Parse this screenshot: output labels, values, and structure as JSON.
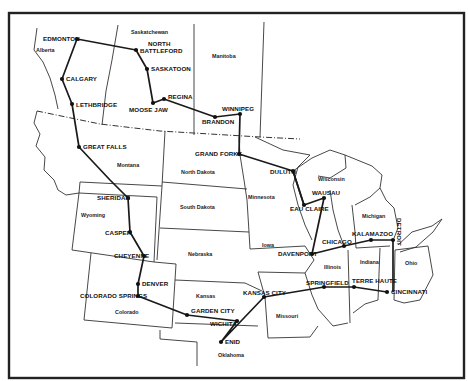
{
  "map": {
    "regions": [
      {
        "id": "alberta",
        "label": "Alberta",
        "x": 36,
        "y": 52
      },
      {
        "id": "saskatchewan",
        "label": "Saskatchewan",
        "x": 131,
        "y": 34
      },
      {
        "id": "manitoba",
        "label": "Manitoba",
        "x": 212,
        "y": 58
      },
      {
        "id": "montana",
        "label": "Montana",
        "x": 117,
        "y": 167
      },
      {
        "id": "north-dakota",
        "label": "North Dakota",
        "x": 181,
        "y": 174
      },
      {
        "id": "south-dakota",
        "label": "South Dakota",
        "x": 180,
        "y": 209
      },
      {
        "id": "minnesota",
        "label": "Minnesota",
        "x": 248,
        "y": 199
      },
      {
        "id": "wisconsin",
        "label": "Wisconsin",
        "x": 318,
        "y": 181
      },
      {
        "id": "michigan",
        "label": "Michigan",
        "x": 362,
        "y": 218
      },
      {
        "id": "wyoming",
        "label": "Wyoming",
        "x": 81,
        "y": 217
      },
      {
        "id": "nebraska",
        "label": "Nebraska",
        "x": 188,
        "y": 256
      },
      {
        "id": "iowa",
        "label": "Iowa",
        "x": 262,
        "y": 247
      },
      {
        "id": "illinois",
        "label": "Illinois",
        "x": 324,
        "y": 269
      },
      {
        "id": "indiana",
        "label": "Indiana",
        "x": 360,
        "y": 264
      },
      {
        "id": "ohio",
        "label": "Ohio",
        "x": 405,
        "y": 265
      },
      {
        "id": "colorado",
        "label": "Colorado",
        "x": 115,
        "y": 314
      },
      {
        "id": "kansas",
        "label": "Kansas",
        "x": 196,
        "y": 298
      },
      {
        "id": "missouri",
        "label": "Missouri",
        "x": 276,
        "y": 318
      },
      {
        "id": "oklahoma",
        "label": "Oklahoma",
        "x": 218,
        "y": 357
      }
    ],
    "cities": [
      {
        "id": "edmonton",
        "label": "EDMONTON",
        "x": 77,
        "y": 39,
        "lx": 43,
        "ly": 41
      },
      {
        "id": "calgary",
        "label": "CALGARY",
        "x": 62,
        "y": 79,
        "lx": 66,
        "ly": 81
      },
      {
        "id": "lethbridge",
        "label": "LETHBRIDGE",
        "x": 72,
        "y": 104,
        "lx": 76,
        "ly": 107
      },
      {
        "id": "north-battleford",
        "label": "NORTH BATTLEFORD",
        "x": 136,
        "y": 50,
        "lx": 140,
        "ly": 53
      },
      {
        "id": "saskatoon",
        "label": "SASKATOON",
        "x": 147,
        "y": 69,
        "lx": 151,
        "ly": 71
      },
      {
        "id": "moose-jaw",
        "label": "MOOSE JAW",
        "x": 153,
        "y": 103,
        "lx": 129,
        "ly": 112
      },
      {
        "id": "regina",
        "label": "REGINA",
        "x": 164,
        "y": 99,
        "lx": 168,
        "ly": 99
      },
      {
        "id": "brandon",
        "label": "BRANDON",
        "x": 215,
        "y": 117,
        "lx": 202,
        "ly": 124
      },
      {
        "id": "winnipeg",
        "label": "WINNIPEG",
        "x": 240,
        "y": 114,
        "lx": 222,
        "ly": 111
      },
      {
        "id": "great-falls",
        "label": "GREAT FALLS",
        "x": 79,
        "y": 147,
        "lx": 83,
        "ly": 149
      },
      {
        "id": "grand-forks",
        "label": "GRAND FORKS",
        "x": 239,
        "y": 154,
        "lx": 195,
        "ly": 156
      },
      {
        "id": "duluth",
        "label": "DULUTH",
        "x": 293,
        "y": 171,
        "lx": 270,
        "ly": 174
      },
      {
        "id": "wausau",
        "label": "WAUSAU",
        "x": 324,
        "y": 198,
        "lx": 312,
        "ly": 195
      },
      {
        "id": "eau-claire",
        "label": "EAU CLAIRE",
        "x": 304,
        "y": 205,
        "lx": 290,
        "ly": 211
      },
      {
        "id": "sheridan",
        "label": "SHERIDAN",
        "x": 128,
        "y": 198,
        "lx": 97,
        "ly": 200
      },
      {
        "id": "casper",
        "label": "CASPER",
        "x": 130,
        "y": 232,
        "lx": 105,
        "ly": 235
      },
      {
        "id": "cheyenne",
        "label": "CHEYENNE",
        "x": 144,
        "y": 256,
        "lx": 114,
        "ly": 258
      },
      {
        "id": "denver",
        "label": "DENVER",
        "x": 138,
        "y": 284,
        "lx": 142,
        "ly": 286
      },
      {
        "id": "colorado-springs",
        "label": "COLORADO SPRINGS",
        "x": 138,
        "y": 296,
        "lx": 80,
        "ly": 298
      },
      {
        "id": "garden-city",
        "label": "GARDEN CITY",
        "x": 187,
        "y": 315,
        "lx": 191,
        "ly": 313
      },
      {
        "id": "wichita",
        "label": "WICHITA",
        "x": 237,
        "y": 321,
        "lx": 210,
        "ly": 326
      },
      {
        "id": "enid",
        "label": "ENID",
        "x": 221,
        "y": 342,
        "lx": 225,
        "ly": 344
      },
      {
        "id": "kansas-city",
        "label": "KANSAS CITY",
        "x": 264,
        "y": 297,
        "lx": 243,
        "ly": 295
      },
      {
        "id": "davenport",
        "label": "DAVENPORT",
        "x": 312,
        "y": 254,
        "lx": 278,
        "ly": 256
      },
      {
        "id": "chicago",
        "label": "CHICAGO",
        "x": 344,
        "y": 246,
        "lx": 322,
        "ly": 244
      },
      {
        "id": "kalamazoo",
        "label": "KALAMAZOO",
        "x": 371,
        "y": 240,
        "lx": 352,
        "ly": 236
      },
      {
        "id": "detroit",
        "label": "DETROIT",
        "x": 393,
        "y": 240,
        "lx": 397,
        "ly": 218
      },
      {
        "id": "springfield",
        "label": "SPRINGFIELD",
        "x": 324,
        "y": 287,
        "lx": 306,
        "ly": 285
      },
      {
        "id": "terre-haute",
        "label": "TERRE HAUTE",
        "x": 354,
        "y": 287,
        "lx": 352,
        "ly": 283
      },
      {
        "id": "cincinnati",
        "label": "CINCINNATI",
        "x": 387,
        "y": 292,
        "lx": 391,
        "ly": 294
      }
    ]
  }
}
